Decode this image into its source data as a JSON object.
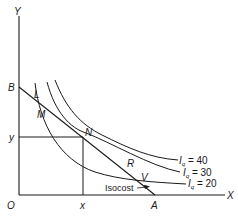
{
  "diagram": {
    "type": "isoquant-isocost",
    "axes": {
      "y_label": "Y",
      "x_label": "X",
      "origin_label": "O"
    },
    "points": {
      "B": "B",
      "A": "A",
      "L": "L",
      "M": "M",
      "N": "N",
      "R": "R",
      "V": "V"
    },
    "equilibrium": {
      "x_label": "x",
      "y_label": "y"
    },
    "isoquants": [
      {
        "symbol": "I",
        "sub": "q",
        "text": " = 40"
      },
      {
        "symbol": "I",
        "sub": "q",
        "text": " = 30"
      },
      {
        "symbol": "I",
        "sub": "q",
        "text": " = 20"
      }
    ],
    "isocost_label": "Isocost",
    "colors": {
      "line": "#1a1a1a",
      "background": "#ffffff"
    }
  }
}
